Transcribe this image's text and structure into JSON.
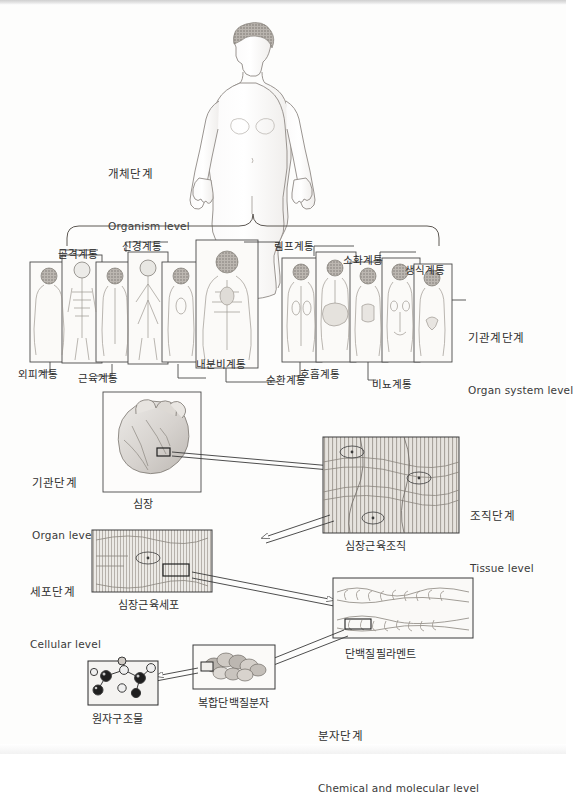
{
  "figure": {
    "title_ko": "인체의 구조적 단계",
    "domain": "anatomy-levels-of-organization"
  },
  "levels": [
    {
      "id": "organism",
      "ko": "개체단계",
      "en": "Organism level"
    },
    {
      "id": "organ_system",
      "ko": "기관계단계",
      "en": "Organ system level"
    },
    {
      "id": "organ",
      "ko": "기관단계",
      "en": "Organ level"
    },
    {
      "id": "tissue",
      "ko": "조직단계",
      "en": "Tissue level"
    },
    {
      "id": "cellular",
      "ko": "세포단계",
      "en": "Cellular level"
    },
    {
      "id": "molecular",
      "ko": "분자단계",
      "en": "Chemical and molecular level"
    }
  ],
  "organ_systems": {
    "top_labels": [
      {
        "ko": "골격계통"
      },
      {
        "ko": "신경계통"
      },
      {
        "ko": "림프계통"
      },
      {
        "ko": "소화계통"
      },
      {
        "ko": "생식계통"
      }
    ],
    "bottom_labels": [
      {
        "ko": "외피계통"
      },
      {
        "ko": "근육계통"
      },
      {
        "ko": "내분비계통"
      },
      {
        "ko": "순환계통"
      },
      {
        "ko": "호흡계통"
      },
      {
        "ko": "비뇨계통"
      }
    ]
  },
  "captions": {
    "heart": "심장",
    "cardiac_muscle_tissue": "심장근육조직",
    "cardiac_muscle_cell": "심장근육세포",
    "protein_filament": "단백질필라멘트",
    "complex_protein_molecule": "복합단백질분자",
    "atomic_structure": "원자구조물"
  },
  "colors": {
    "ink": "#2b2b2b",
    "line": "#3a3a3a",
    "paper": "#fdfdfc",
    "panel_fill": "#f6f5f3",
    "heart_fill": "#d9d6d2",
    "tissue_fill": "#e2dfda"
  }
}
